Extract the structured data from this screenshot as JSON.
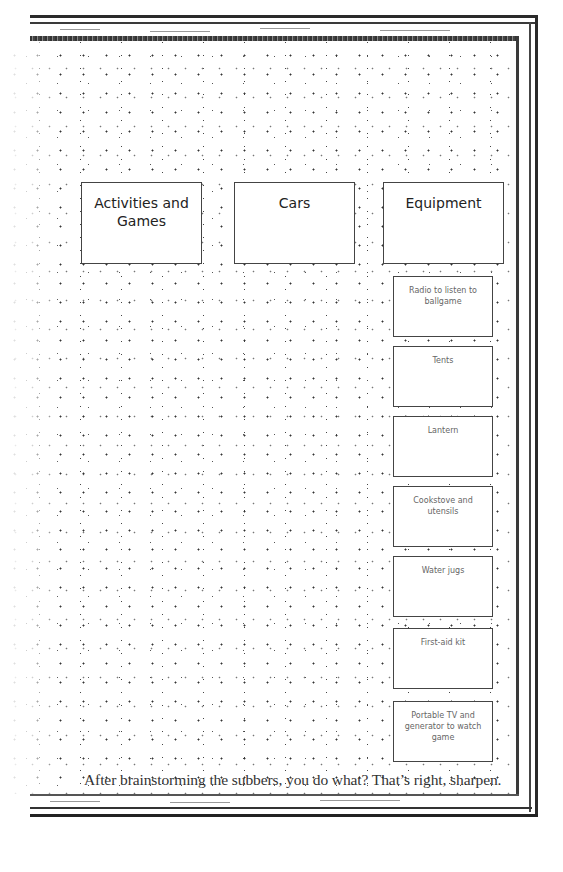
{
  "diagram": {
    "categories": [
      {
        "label": "Activities and Games"
      },
      {
        "label": "Cars"
      },
      {
        "label": "Equipment"
      }
    ],
    "equipment_items": [
      {
        "label": "Radio to listen to ballgame"
      },
      {
        "label": "Tents"
      },
      {
        "label": "Lantern"
      },
      {
        "label": "Cookstove and utensils"
      },
      {
        "label": "Water jugs"
      },
      {
        "label": "First-aid kit"
      },
      {
        "label": "Portable TV and generator to watch game"
      }
    ],
    "caption": "After brainstorming the subbers, you do what? That’s right, sharpen."
  },
  "colors": {
    "frame": "#2a2a2a",
    "box_border": "#444444",
    "category_text": "#222222",
    "item_text": "#666666",
    "caption_text": "#333333"
  }
}
